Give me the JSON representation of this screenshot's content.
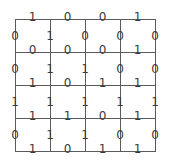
{
  "grid": {
    "rows": 4,
    "cols": 4,
    "x_lines": [
      15,
      50,
      85,
      120,
      155
    ],
    "y_lines": [
      19,
      52,
      85,
      118,
      151
    ],
    "line_color": "#5a5a5a",
    "label_color": "#3a3a3a"
  },
  "horizontal_edges": [
    [
      "1",
      "0",
      "0",
      "1"
    ],
    [
      "0",
      "0",
      "0",
      "1"
    ],
    [
      "1",
      "0",
      "1",
      "1"
    ],
    [
      "1",
      "1",
      "0",
      "1"
    ],
    [
      "1",
      "0",
      "1",
      "1"
    ]
  ],
  "vertical_edges": [
    [
      "0",
      "1",
      "0",
      "0",
      "0"
    ],
    [
      "0",
      "1",
      "1",
      "0",
      "0"
    ],
    [
      "1",
      "1",
      "1",
      "1",
      "1"
    ],
    [
      "0",
      "1",
      "1",
      "0",
      "0"
    ]
  ]
}
